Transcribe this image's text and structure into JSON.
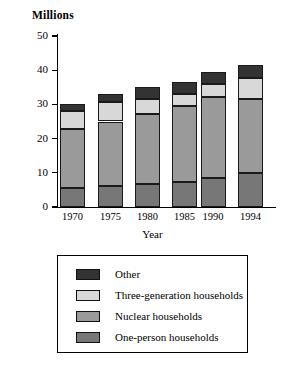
{
  "chart_data": {
    "type": "bar",
    "subtype": "stacked-bar",
    "title": "",
    "ylabel": "Millions",
    "xlabel": "Year",
    "categories": [
      "1970",
      "1975",
      "1980",
      "1985",
      "1990",
      "1994"
    ],
    "ylim": [
      0,
      50
    ],
    "yticks": [
      0,
      10,
      20,
      30,
      40,
      50
    ],
    "ytick_labels": [
      "0",
      "10",
      "20",
      "30",
      "40",
      "50"
    ],
    "grid": false,
    "legend_position": "below-plot",
    "stack_order_bottom_to_top": [
      "One-person households",
      "Nuclear households",
      "Three-generation households",
      "Other"
    ],
    "series": [
      {
        "name": "One-person households",
        "color": "#777777",
        "values": [
          5.5,
          6.1,
          6.7,
          7.3,
          8.5,
          9.9
        ]
      },
      {
        "name": "Nuclear households",
        "color": "#9a9a9a",
        "values": [
          17.3,
          18.9,
          20.5,
          22.2,
          23.7,
          21.7
        ]
      },
      {
        "name": "Three-generation households",
        "color": "#d8d8d8",
        "values": [
          5.3,
          5.6,
          4.4,
          3.5,
          3.8,
          6.1
        ]
      },
      {
        "name": "Other",
        "color": "#333333",
        "values": [
          1.9,
          2.4,
          3.4,
          3.6,
          3.5,
          3.8
        ]
      }
    ],
    "totals": [
      30.0,
      33.0,
      35.0,
      36.6,
      39.5,
      41.5
    ]
  },
  "axis": {
    "y_title": "Millions",
    "x_title": "Year"
  },
  "legend": {
    "items": [
      {
        "label": "Other",
        "color": "#333333"
      },
      {
        "label": "Three-generation households",
        "color": "#d8d8d8"
      },
      {
        "label": "Nuclear households",
        "color": "#9a9a9a"
      },
      {
        "label": "One-person households",
        "color": "#777777"
      }
    ]
  }
}
